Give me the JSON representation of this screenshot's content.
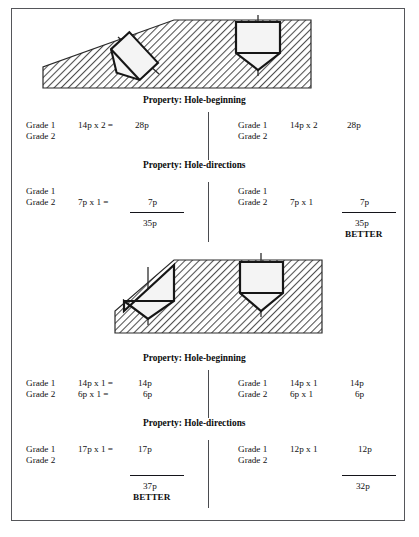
{
  "figure": {
    "frame_color": "#55565a",
    "hatch_color": "#5a5a5a",
    "tool_outline_color": "#111111",
    "units_suffix": "p"
  },
  "sections": [
    {
      "id": "upper",
      "drawing": {
        "name": "workpiece-chamfered-block-upper",
        "left_tool": "tilted-drill",
        "right_tool": "upright-drill"
      },
      "property_beginning": "Property: Hole-beginning",
      "property_directions": "Property: Hole-directions",
      "left": {
        "beginning": {
          "rows": [
            {
              "grade": "Grade 1",
              "expr": "14p x 2 =",
              "value": "28p"
            },
            {
              "grade": "Grade 2",
              "expr": "",
              "value": ""
            }
          ]
        },
        "directions": {
          "rows": [
            {
              "grade": "Grade 1",
              "expr": "",
              "value": ""
            },
            {
              "grade": "Grade 2",
              "expr": "7p x 1 =",
              "value": "7p"
            }
          ],
          "total": "35p",
          "better": ""
        }
      },
      "right": {
        "beginning": {
          "rows": [
            {
              "grade": "Grade 1",
              "expr": "14p x 2",
              "value": "28p"
            },
            {
              "grade": "Grade 2",
              "expr": "",
              "value": ""
            }
          ]
        },
        "directions": {
          "rows": [
            {
              "grade": "Grade 1",
              "expr": "",
              "value": ""
            },
            {
              "grade": "Grade 2",
              "expr": "7p x 1",
              "value": "7p"
            }
          ],
          "total": "35p",
          "better": "BETTER"
        }
      }
    },
    {
      "id": "lower",
      "drawing": {
        "name": "workpiece-chamfered-block-lower",
        "left_tool": "upright-drill-clipped",
        "right_tool": "upright-drill"
      },
      "property_beginning": "Property: Hole-beginning",
      "property_directions": "Property: Hole-directions",
      "left": {
        "beginning": {
          "rows": [
            {
              "grade": "Grade 1",
              "expr": "14p x 1 =",
              "value": "14p"
            },
            {
              "grade": "Grade 2",
              "expr": "6p x 1 =",
              "value": "6p"
            }
          ]
        },
        "directions": {
          "rows": [
            {
              "grade": "Grade 1",
              "expr": "17p x 1 =",
              "value": "17p"
            },
            {
              "grade": "Grade 2",
              "expr": "",
              "value": ""
            }
          ],
          "total": "37p",
          "better": "BETTER"
        }
      },
      "right": {
        "beginning": {
          "rows": [
            {
              "grade": "Grade 1",
              "expr": "14p x 1",
              "value": "14p"
            },
            {
              "grade": "Grade 2",
              "expr": "6p x 1",
              "value": "6p"
            }
          ]
        },
        "directions": {
          "rows": [
            {
              "grade": "Grade 1",
              "expr": "12p x 1",
              "value": "12p"
            },
            {
              "grade": "Grade 2",
              "expr": "",
              "value": ""
            }
          ],
          "total": "32p",
          "better": ""
        }
      }
    }
  ]
}
